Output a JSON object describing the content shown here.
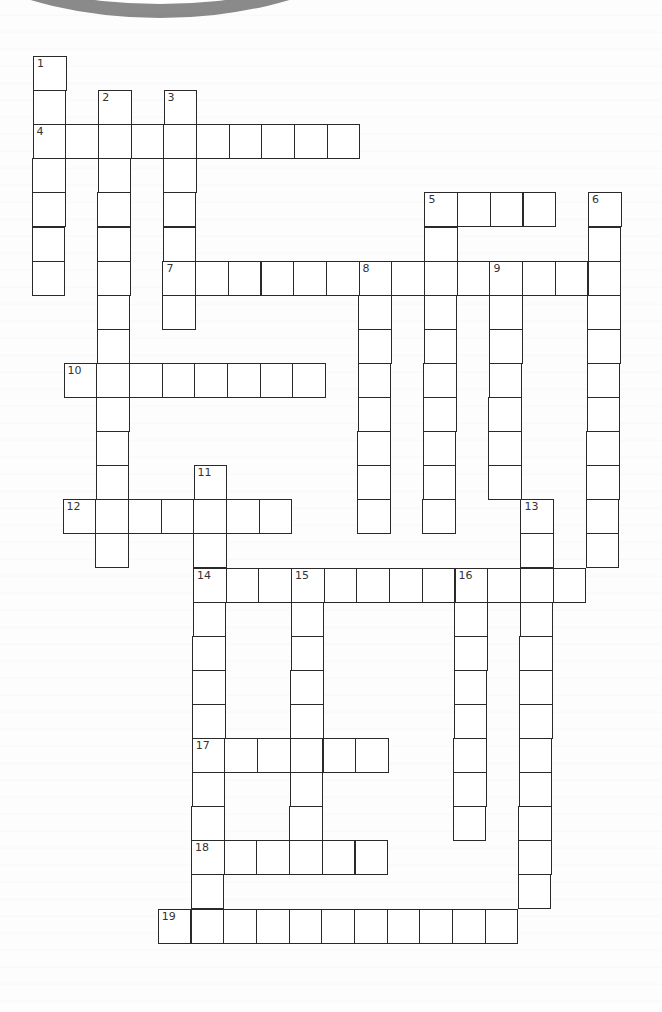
{
  "puzzle": {
    "type": "crossword",
    "words": [
      {
        "number": "1",
        "dir": "down",
        "row": 0,
        "col": 0,
        "length": 7
      },
      {
        "number": "2",
        "dir": "down",
        "row": 1,
        "col": 2,
        "length": 14
      },
      {
        "number": "3",
        "dir": "down",
        "row": 1,
        "col": 4,
        "length": 7
      },
      {
        "number": "4",
        "dir": "across",
        "row": 2,
        "col": 0,
        "length": 10
      },
      {
        "number": "5",
        "dir": "across",
        "row": 4,
        "col": 12,
        "length": 4
      },
      {
        "number": "5",
        "dir": "down",
        "row": 4,
        "col": 12,
        "length": 10
      },
      {
        "number": "6",
        "dir": "down",
        "row": 4,
        "col": 17,
        "length": 11
      },
      {
        "number": "7",
        "dir": "across",
        "row": 6,
        "col": 4,
        "length": 14
      },
      {
        "number": "8",
        "dir": "down",
        "row": 6,
        "col": 10,
        "length": 8
      },
      {
        "number": "9",
        "dir": "down",
        "row": 6,
        "col": 14,
        "length": 7
      },
      {
        "number": "10",
        "dir": "across",
        "row": 9,
        "col": 1,
        "length": 8
      },
      {
        "number": "11",
        "dir": "down",
        "row": 12,
        "col": 5,
        "length": 14
      },
      {
        "number": "12",
        "dir": "across",
        "row": 13,
        "col": 1,
        "length": 7
      },
      {
        "number": "13",
        "dir": "down",
        "row": 13,
        "col": 15,
        "length": 12
      },
      {
        "number": "14",
        "dir": "across",
        "row": 15,
        "col": 5,
        "length": 12
      },
      {
        "number": "15",
        "dir": "down",
        "row": 15,
        "col": 8,
        "length": 8
      },
      {
        "number": "16",
        "dir": "down",
        "row": 15,
        "col": 13,
        "length": 8
      },
      {
        "number": "17",
        "dir": "across",
        "row": 20,
        "col": 5,
        "length": 6
      },
      {
        "number": "18",
        "dir": "across",
        "row": 23,
        "col": 5,
        "length": 6
      },
      {
        "number": "19",
        "dir": "across",
        "row": 25,
        "col": 4,
        "length": 11
      }
    ]
  }
}
